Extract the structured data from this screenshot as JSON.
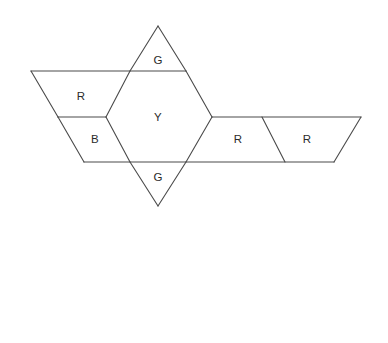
{
  "figure": {
    "background_color": "#ffffff",
    "stroke_color": "#4a4a4a",
    "fill_color": "#ffffff",
    "stroke_width": 1.1,
    "width": 388,
    "height": 343
  },
  "tiles": [
    {
      "id": "top-triangle",
      "label": "G",
      "shape": "triangle",
      "label_x": 158,
      "label_y": 60,
      "points": "158,26 186,71 130,71"
    },
    {
      "id": "upper-left-rhombus",
      "label": "R",
      "shape": "rhombus",
      "label_x": 81,
      "label_y": 96,
      "points": "31,71 130,71 106,117 58,117"
    },
    {
      "id": "lower-left-rhombus",
      "label": "B",
      "shape": "rhombus",
      "label_x": 95,
      "label_y": 139,
      "points": "58,117 106,117 130,162 84,162"
    },
    {
      "id": "center-hexagon",
      "label": "Y",
      "shape": "hexagon",
      "label_x": 158,
      "label_y": 117,
      "points": "130,71 186,71 212,117 186,162 130,162 106,117"
    },
    {
      "id": "bottom-triangle",
      "label": "G",
      "shape": "triangle",
      "label_x": 158,
      "label_y": 177,
      "points": "130,162 186,162 158,206"
    },
    {
      "id": "inner-right-rhombus",
      "label": "R",
      "shape": "rhombus",
      "label_x": 238,
      "label_y": 139,
      "points": "212,117 262,117 285,162 186,162"
    },
    {
      "id": "outer-right-rhombus",
      "label": "R",
      "shape": "rhombus",
      "label_x": 307,
      "label_y": 139,
      "points": "262,117 361,117 334,162 285,162"
    }
  ],
  "edges": [
    {
      "id": "edge-top-left-apex",
      "x1": 158,
      "y1": 26,
      "x2": 130,
      "y2": 71
    },
    {
      "id": "edge-top-right-apex",
      "x1": 158,
      "y1": 26,
      "x2": 186,
      "y2": 71
    },
    {
      "id": "edge-top-horizontal",
      "x1": 31,
      "y1": 71,
      "x2": 186,
      "y2": 71
    },
    {
      "id": "edge-left-upper-slant",
      "x1": 31,
      "y1": 71,
      "x2": 58,
      "y2": 117
    },
    {
      "id": "edge-left-middle-horizontal",
      "x1": 58,
      "y1": 117,
      "x2": 106,
      "y2": 117
    },
    {
      "id": "edge-left-lower-slant",
      "x1": 58,
      "y1": 117,
      "x2": 84,
      "y2": 162
    },
    {
      "id": "edge-bottom-horizontal",
      "x1": 84,
      "y1": 162,
      "x2": 334,
      "y2": 162
    },
    {
      "id": "edge-hex-upper-left",
      "x1": 130,
      "y1": 71,
      "x2": 106,
      "y2": 117
    },
    {
      "id": "edge-hex-lower-left",
      "x1": 106,
      "y1": 117,
      "x2": 130,
      "y2": 162
    },
    {
      "id": "edge-hex-upper-right",
      "x1": 186,
      "y1": 71,
      "x2": 212,
      "y2": 117
    },
    {
      "id": "edge-hex-lower-right",
      "x1": 212,
      "y1": 117,
      "x2": 186,
      "y2": 162
    },
    {
      "id": "edge-bottom-tri-left",
      "x1": 130,
      "y1": 162,
      "x2": 158,
      "y2": 206
    },
    {
      "id": "edge-bottom-tri-right",
      "x1": 186,
      "y1": 162,
      "x2": 158,
      "y2": 206
    },
    {
      "id": "edge-right-top-horizontal",
      "x1": 212,
      "y1": 117,
      "x2": 361,
      "y2": 117
    },
    {
      "id": "edge-right-divider",
      "x1": 262,
      "y1": 117,
      "x2": 285,
      "y2": 162
    },
    {
      "id": "edge-right-end-slant",
      "x1": 361,
      "y1": 117,
      "x2": 334,
      "y2": 162
    }
  ]
}
